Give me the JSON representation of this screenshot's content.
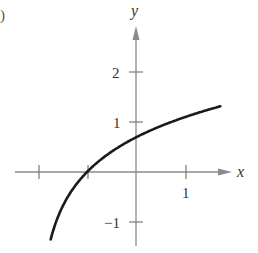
{
  "panel_label": ")",
  "chart_data": {
    "type": "line",
    "title": "",
    "function": "y = ln(x + 2)",
    "xlabel": "x",
    "ylabel": "y",
    "xlim": [
      -2.5,
      2.2
    ],
    "ylim": [
      -1.5,
      2.8
    ],
    "x_ticks": [
      -2,
      -1,
      1
    ],
    "x_tick_labels": [
      {
        "value": 1,
        "label": "1"
      }
    ],
    "y_ticks": [
      2,
      1,
      -1
    ],
    "y_tick_labels": [
      {
        "value": 2,
        "label": "2"
      },
      {
        "value": 1,
        "label": "1"
      },
      {
        "value": -1,
        "label": "−1"
      }
    ],
    "grid": false,
    "legend": null,
    "series": [
      {
        "name": "curve",
        "x": [
          -1.74,
          -1.6,
          -1.4,
          -1.2,
          -1.0,
          -0.8,
          -0.5,
          0.0,
          0.5,
          1.0,
          1.5,
          1.72
        ],
        "y": [
          -1.35,
          -0.92,
          -0.51,
          -0.22,
          0.0,
          0.18,
          0.41,
          0.69,
          0.92,
          1.1,
          1.25,
          1.31
        ]
      }
    ],
    "key_points": [
      {
        "x": -1,
        "y": 0,
        "note": "x-intercept"
      },
      {
        "x": 0,
        "y": 0.69,
        "note": "y-intercept"
      }
    ]
  },
  "labels": {
    "x_axis": "x",
    "y_axis": "y",
    "y_tick_2": "2",
    "y_tick_1": "1",
    "y_tick_neg1": "−1",
    "x_tick_1": "1"
  }
}
